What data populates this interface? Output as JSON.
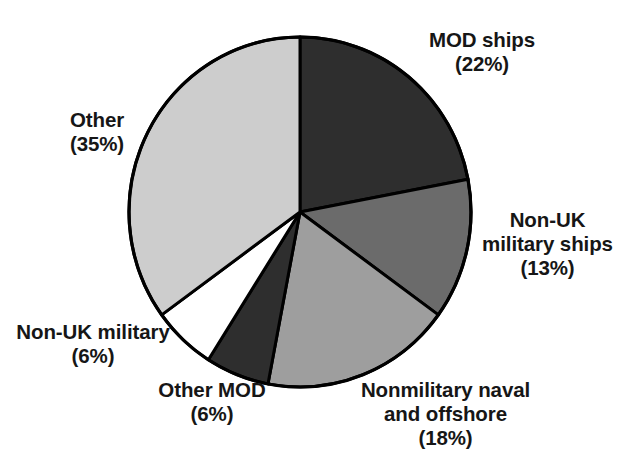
{
  "figure": {
    "background_color": "#ffffff",
    "outline_color": "#000000"
  },
  "chart_data": {
    "type": "pie",
    "title": "",
    "subtitle": "",
    "xlabel": "",
    "ylabel": "",
    "legend_position": "none",
    "grid": false,
    "start_angle_deg": 0,
    "direction": "clockwise",
    "categories": [
      "MOD ships",
      "Non-UK military ships",
      "Nonmilitary naval and offshore",
      "Other MOD",
      "Non-UK military",
      "Other"
    ],
    "values": [
      22,
      13,
      18,
      6,
      6,
      35
    ],
    "value_unit": "percent",
    "colors": [
      "#2e2e2e",
      "#6b6b6b",
      "#9e9e9e",
      "#2e2e2e",
      "#ffffff",
      "#cdcdcd"
    ],
    "slices": [
      {
        "name": "MOD ships",
        "value": 22,
        "percent_text": "(22%)",
        "label_line_1": "MOD ships",
        "label_line_2": "(22%)",
        "color": "#2e2e2e"
      },
      {
        "name": "Non-UK military ships",
        "value": 13,
        "percent_text": "(13%)",
        "label_line_1": "Non-UK",
        "label_line_2": "military ships",
        "label_line_3": "(13%)",
        "color": "#6b6b6b"
      },
      {
        "name": "Nonmilitary naval and offshore",
        "value": 18,
        "percent_text": "(18%)",
        "label_line_1": "Nonmilitary naval",
        "label_line_2": "and offshore",
        "label_line_3": "(18%)",
        "color": "#9e9e9e"
      },
      {
        "name": "Other MOD",
        "value": 6,
        "percent_text": "(6%)",
        "label_line_1": "Other MOD",
        "label_line_2": "(6%)",
        "color": "#2e2e2e"
      },
      {
        "name": "Non-UK military",
        "value": 6,
        "percent_text": "(6%)",
        "label_line_1": "Non-UK military",
        "label_line_2": "(6%)",
        "color": "#ffffff"
      },
      {
        "name": "Other",
        "value": 35,
        "percent_text": "(35%)",
        "label_line_1": "Other",
        "label_line_2": "(35%)",
        "color": "#cdcdcd"
      }
    ]
  },
  "labels": {
    "mod_ships": "MOD ships\n(22%)",
    "nonuk_military_ships": "Non-UK\nmilitary ships\n(13%)",
    "nonmilitary_naval": "Nonmilitary naval\nand offshore\n(18%)",
    "other_mod": "Other MOD\n(6%)",
    "nonuk_military": "Non-UK military\n(6%)",
    "other": "Other\n(35%)"
  }
}
